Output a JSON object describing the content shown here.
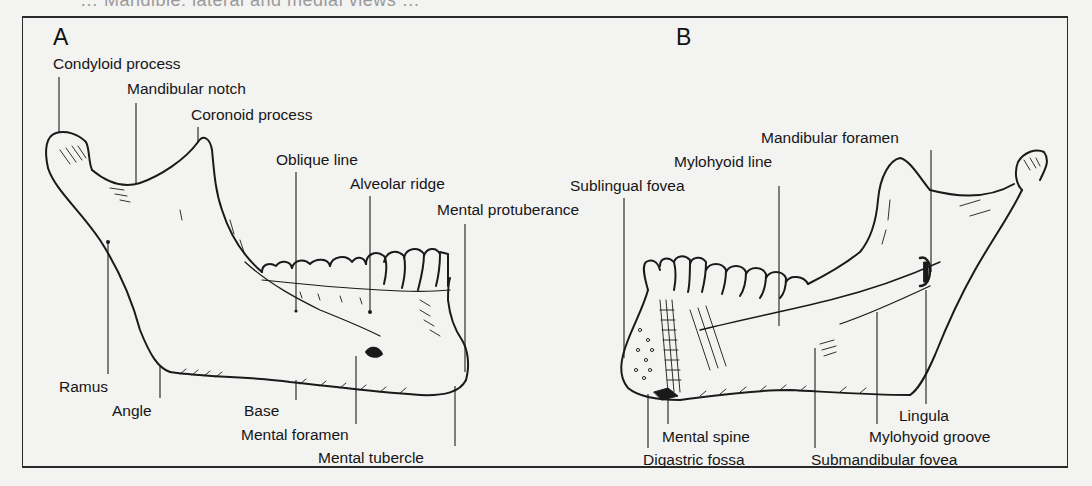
{
  "figure": {
    "caption_partial": "… Mandible: lateral and medial views …",
    "panels": [
      {
        "id": "A",
        "letter": "A",
        "view": "lateral",
        "labels": {
          "condyloid_process": "Condyloid process",
          "mandibular_notch": "Mandibular notch",
          "coronoid_process": "Coronoid process",
          "oblique_line": "Oblique line",
          "alveolar_ridge": "Alveolar ridge",
          "mental_protuberance": "Mental protuberance",
          "ramus": "Ramus",
          "angle": "Angle",
          "base": "Base",
          "mental_foramen": "Mental foramen",
          "mental_tubercle": "Mental tubercle"
        }
      },
      {
        "id": "B",
        "letter": "B",
        "view": "medial",
        "labels": {
          "mandibular_foramen": "Mandibular foramen",
          "mylohyoid_line": "Mylohyoid line",
          "sublingual_fovea": "Sublingual fovea",
          "lingula": "Lingula",
          "mylohyoid_groove": "Mylohyoid groove",
          "mental_spine": "Mental spine",
          "digastric_fossa": "Digastric fossa",
          "submandibular_fovea": "Submandibular fovea"
        }
      }
    ]
  },
  "colors": {
    "paper": "#f3f3f1",
    "ink": "#1a1a1a",
    "frame": "#2a2a2a"
  }
}
